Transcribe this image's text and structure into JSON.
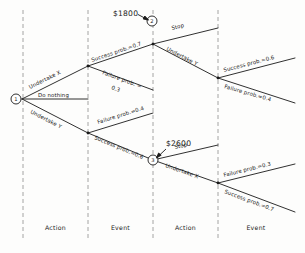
{
  "diagram": {
    "type": "decision-tree",
    "stroke_color": "#1a1a1a",
    "divider_color": "#8d8d8d",
    "background": "#fdfdfc"
  },
  "columns": [
    {
      "label": "Action"
    },
    {
      "label": "Event"
    },
    {
      "label": "Action"
    },
    {
      "label": "Event"
    }
  ],
  "nodes": [
    {
      "id": "node-1",
      "label": "1",
      "shape": "circle"
    },
    {
      "id": "node-2",
      "label": "2",
      "shape": "circle"
    },
    {
      "id": "node-3",
      "label": "3",
      "shape": "circle"
    }
  ],
  "payoffs": [
    {
      "id": "payoff-1800",
      "value": "$1800",
      "points_to": "node-2"
    },
    {
      "id": "payoff-2600",
      "value": "$2600",
      "points_to": "node-3"
    }
  ],
  "branches": {
    "root_undertake_x": "Undertake X",
    "root_do_nothing": "Do nothing",
    "root_undertake_y": "Undertake Y",
    "x_success": "Success prob.=0.7",
    "x_failure_line1": "Failure prob. =",
    "x_failure_line2": "0.3",
    "y_failure": "Failure prob.=0.4",
    "y_success": "Success prob.=0.6",
    "node2_stop": "Stop",
    "node2_undertake_y": "Undertake Y",
    "node3_stop": "Stop",
    "node3_undertake_x": "Undertake X",
    "upper_right_success": "Success prob.=0.6",
    "upper_right_failure": "Failure prob.=0.4",
    "lower_right_failure": "Failure prob.=0.3",
    "lower_right_success": "Success prob.=0.7"
  }
}
